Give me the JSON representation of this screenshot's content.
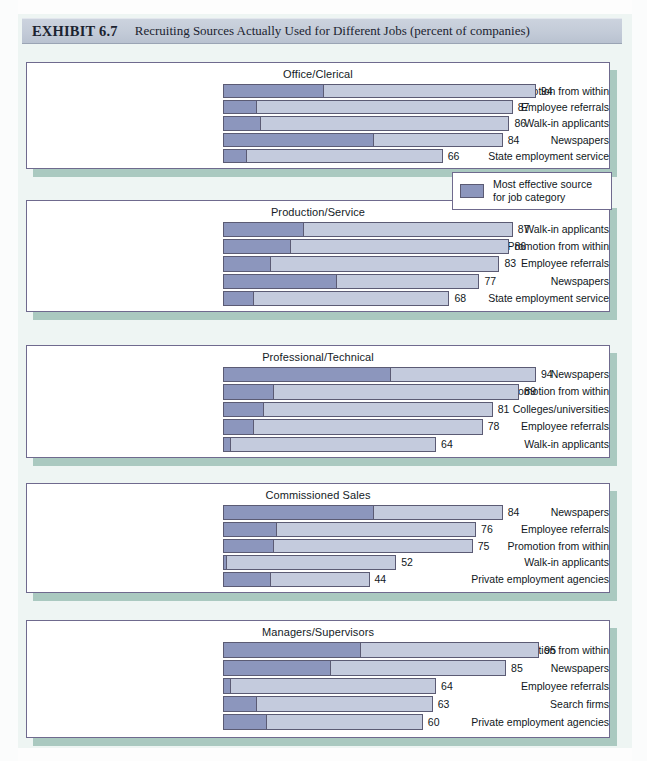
{
  "exhibit": {
    "number": "EXHIBIT 6.7",
    "title": "Recruiting Sources Actually Used for Different Jobs (percent of companies)"
  },
  "legend": {
    "line1": "Most effective source",
    "line2": "for job category",
    "swatch_color": "#8c96bd"
  },
  "colors": {
    "bar_light": "#c4cbdd",
    "bar_dark": "#8c96bd",
    "bar_border": "#5b5b74",
    "panel_border": "#6f6a8e",
    "panel_shadow": "#9dc1b6",
    "page_background": "#eef5f3",
    "title_band": "#c3cbd8"
  },
  "chart_data": {
    "type": "bar",
    "title": "Recruiting Sources Actually Used for Different Jobs (percent of companies)",
    "xlabel": "percent of companies",
    "ylabel": "",
    "xlim": [
      0,
      100
    ],
    "grid": false,
    "orientation": "horizontal",
    "legend": "Most effective source for job category",
    "legend_position": "middle-right",
    "note": "Each bar's dark left segment indicates the share citing it as the most effective source for that job category.",
    "panels": [
      {
        "title": "Office/Clerical",
        "categories": [
          "Promotion from within",
          "Employee referrals",
          "Walk-in applicants",
          "Newspapers",
          "State employment service"
        ],
        "values": [
          94,
          87,
          86,
          84,
          66
        ],
        "effective_segment": [
          30,
          10,
          11,
          45,
          7
        ]
      },
      {
        "title": "Production/Service",
        "categories": [
          "Walk-in applicants",
          "Promotion from within",
          "Employee referrals",
          "Newspapers",
          "State employment service"
        ],
        "values": [
          87,
          86,
          83,
          77,
          68
        ],
        "effective_segment": [
          24,
          20,
          14,
          34,
          9
        ]
      },
      {
        "title": "Professional/Technical",
        "categories": [
          "Newspapers",
          "Promotion from within",
          "Colleges/universities",
          "Employee referrals",
          "Walk-in applicants"
        ],
        "values": [
          94,
          89,
          81,
          78,
          64
        ],
        "effective_segment": [
          50,
          15,
          12,
          9,
          2
        ]
      },
      {
        "title": "Commissioned Sales",
        "categories": [
          "Newspapers",
          "Employee referrals",
          "Promotion from within",
          "Walk-in applicants",
          "Private employment agencies"
        ],
        "values": [
          84,
          76,
          75,
          52,
          44
        ],
        "effective_segment": [
          45,
          16,
          15,
          1,
          14
        ]
      },
      {
        "title": "Managers/Supervisors",
        "categories": [
          "Promotion from within",
          "Newspapers",
          "Employee referrals",
          "Search firms",
          "Private employment agencies"
        ],
        "values": [
          95,
          85,
          64,
          63,
          60
        ],
        "effective_segment": [
          41,
          32,
          2,
          10,
          13
        ]
      }
    ]
  }
}
